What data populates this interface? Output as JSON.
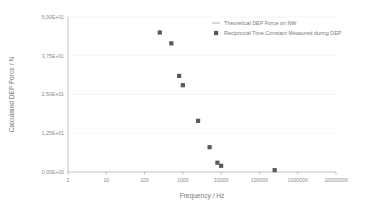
{
  "chart_data": {
    "type": "scatter",
    "title": "",
    "xlabel": "Frequency / Hz",
    "ylabel": "Calculated DEP Force / N",
    "xscale": "log",
    "yscale": "linear",
    "xlim": [
      1,
      10000000
    ],
    "ylim": [
      0,
      50
    ],
    "grid": true,
    "legend_position": "top-right",
    "xticklabels": [
      "1",
      "10",
      "100",
      "1000",
      "10000",
      "100000",
      "1000000",
      "10000000"
    ],
    "xtickvalues": [
      1,
      10,
      100,
      1000,
      10000,
      100000,
      1000000,
      10000000
    ],
    "yticklabels": [
      "0,00E+00",
      "1,25E+01",
      "2,50E+01",
      "3,75E+01",
      "5,00E+01"
    ],
    "ytickvalues": [
      0,
      12.5,
      25,
      37.5,
      50
    ],
    "series": [
      {
        "name": "Theoretical DEP Force on NW",
        "marker": "line",
        "color": "#a6a6a6",
        "x": [],
        "y": []
      },
      {
        "name": "Reciprocial Time Constant Measured during DEP",
        "marker": "square",
        "color": "#595959",
        "x": [
          250,
          500,
          800,
          1000,
          2500,
          5000,
          8000,
          10000,
          250000
        ],
        "y": [
          45.0,
          41.5,
          31.0,
          28.0,
          16.5,
          8.0,
          3.0,
          2.0,
          0.6
        ]
      }
    ]
  },
  "legend": {
    "items": [
      {
        "label": "Theoretical DEP Force on NW",
        "marker": "line"
      },
      {
        "label": "Reciprocial Time Constant Measured during DEP",
        "marker": "square"
      }
    ]
  },
  "colors": {
    "marker": "#595959",
    "axis": "#a6a6a6",
    "grid": "#ededed",
    "text": "#7a7a7a",
    "background": "#ffffff"
  }
}
